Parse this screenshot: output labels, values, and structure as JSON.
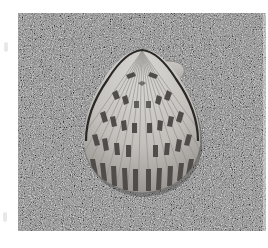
{
  "image": {
    "subject": "scallop shell on sand",
    "description": "Photograph of a ribbed scallop shell with dark brown-gray chevron mottling resting on coarse gray sand",
    "palette": {
      "background": "#ffffff",
      "sand_base": "#8a8a8a",
      "sand_light": "#c8c8c8",
      "sand_dark": "#3c3c3c",
      "shell_light": "#d4d2cf",
      "shell_mid": "#b3b0ac",
      "shell_dark": "#4f4c49",
      "shell_outline": "#2a2928"
    }
  }
}
